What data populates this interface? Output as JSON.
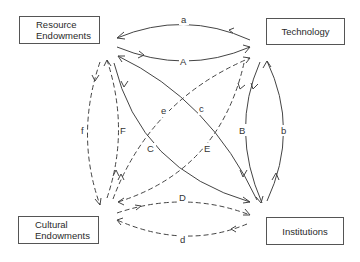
{
  "nodes": {
    "resource_endowments": {
      "line1": "Resource",
      "line2": "Endowments"
    },
    "technology": {
      "label": "Technology"
    },
    "cultural_endowments": {
      "line1": "Cultural",
      "line2": "Endowments"
    },
    "institutions": {
      "label": "Institutions"
    }
  },
  "edges": [
    {
      "id": "a",
      "label": "a",
      "from": "Technology",
      "to": "Resource Endowments",
      "style": "solid"
    },
    {
      "id": "A",
      "label": "A",
      "from": "Resource Endowments",
      "to": "Technology",
      "style": "solid"
    },
    {
      "id": "b",
      "label": "b",
      "from": "Institutions",
      "to": "Technology",
      "style": "solid"
    },
    {
      "id": "B",
      "label": "B",
      "from": "Technology",
      "to": "Institutions",
      "style": "solid"
    },
    {
      "id": "c",
      "label": "c",
      "from": "Institutions",
      "to": "Resource Endowments",
      "style": "solid"
    },
    {
      "id": "C",
      "label": "C",
      "from": "Resource Endowments",
      "to": "Institutions",
      "style": "solid"
    },
    {
      "id": "d",
      "label": "d",
      "from": "Institutions",
      "to": "Cultural Endowments",
      "style": "dashed"
    },
    {
      "id": "D",
      "label": "D",
      "from": "Cultural Endowments",
      "to": "Institutions",
      "style": "dashed"
    },
    {
      "id": "e",
      "label": "e",
      "from": "Cultural Endowments",
      "to": "Technology",
      "style": "dashed"
    },
    {
      "id": "E",
      "label": "E",
      "from": "Technology",
      "to": "Cultural Endowments",
      "style": "dashed"
    },
    {
      "id": "f",
      "label": "f",
      "from": "Resource Endowments",
      "to": "Cultural Endowments",
      "style": "dashed"
    },
    {
      "id": "F",
      "label": "F",
      "from": "Cultural Endowments",
      "to": "Resource Endowments",
      "style": "dashed"
    }
  ],
  "colors": {
    "line": "#444444",
    "text": "#2a2a2a",
    "background": "#ffffff"
  }
}
